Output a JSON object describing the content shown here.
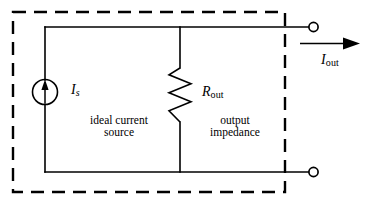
{
  "figure": {
    "kind": "circuit-schematic",
    "colors": {
      "line": "#000000",
      "background": "#ffffff",
      "dashed_border": "#000000"
    }
  },
  "labels": {
    "source_symbol": "I",
    "source_symbol_sub": "s",
    "source_caption_line1": "ideal current",
    "source_caption_line2": "source",
    "resistor_symbol": "R",
    "resistor_symbol_sub": "out",
    "resistor_caption_line1": "output",
    "resistor_caption_line2": "impedance",
    "current_symbol": "I",
    "current_symbol_sub": "out"
  },
  "components": {
    "current_source": {
      "name": "ideal current source",
      "symbol": "circle-with-up-arrow",
      "direction": "up"
    },
    "resistor": {
      "name": "output impedance",
      "symbol": "zigzag",
      "orientation": "vertical"
    },
    "terminals": [
      {
        "name": "top-output-terminal",
        "style": "open-circle"
      },
      {
        "name": "bottom-output-terminal",
        "style": "open-circle"
      }
    ],
    "current_arrow": {
      "name": "output current arrow",
      "direction": "right"
    },
    "enclosure": {
      "name": "dashed device boundary",
      "style": "dashed-rectangle"
    }
  }
}
